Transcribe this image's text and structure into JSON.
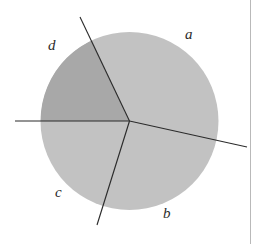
{
  "figure": {
    "type": "sector-partitioned-disk",
    "caption": "",
    "canvas": {
      "width": 261,
      "height": 244,
      "background": "#ffffff"
    },
    "circle": {
      "center_x": 129.5,
      "center_y": 121,
      "radius": 89,
      "outline": "none"
    },
    "colors": {
      "light_fill": "#c2c2c2",
      "dark_fill": "#a8a8a8",
      "line": "#2b2b2b",
      "label_text": "#2b2b2b",
      "border_rule": "#b9b9b9"
    },
    "rays": [
      {
        "name": "ray-left-horizontal",
        "angle_deg": 180,
        "end_x": 15,
        "end_y": 121,
        "extends_beyond_circle": true
      },
      {
        "name": "ray-upper-left",
        "angle_deg": 115,
        "end_x": 80,
        "end_y": 17,
        "extends_beyond_circle": true
      },
      {
        "name": "ray-lower-left",
        "angle_deg": 253,
        "end_x": 97,
        "end_y": 225,
        "extends_beyond_circle": true
      },
      {
        "name": "ray-lower-right",
        "angle_deg": 349,
        "end_x": 247,
        "end_y": 147,
        "extends_beyond_circle": true
      }
    ],
    "regions": [
      {
        "id": "a",
        "label": "a",
        "shade": "light",
        "fill": "#c2c2c2",
        "label_x": 185,
        "label_y": 27
      },
      {
        "id": "b",
        "label": "b",
        "shade": "light",
        "fill": "#c2c2c2",
        "label_x": 163,
        "label_y": 206
      },
      {
        "id": "c",
        "label": "c",
        "shade": "light",
        "fill": "#c2c2c2",
        "label_x": 55,
        "label_y": 185
      },
      {
        "id": "d",
        "label": "d",
        "shade": "dark",
        "fill": "#a8a8a8",
        "label_x": 48,
        "label_y": 38
      }
    ],
    "right_rule": {
      "x": 250,
      "width": 1,
      "color": "#b9b9b9"
    }
  }
}
